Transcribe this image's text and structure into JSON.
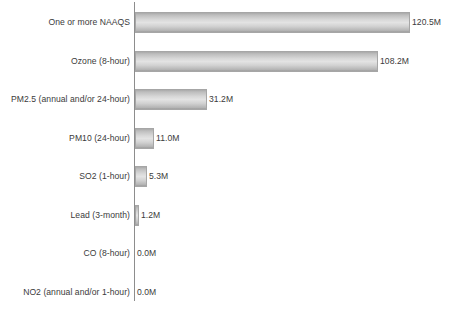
{
  "chart_data": {
    "type": "bar",
    "orientation": "horizontal",
    "title": "",
    "subtitle": "",
    "xlabel": "",
    "ylabel": "",
    "grid": false,
    "legend": null,
    "axis_line": "vertical baseline at value 0",
    "units": "millions of people",
    "value_suffix": "M",
    "xlim": [
      0,
      138
    ],
    "categories": [
      "One or more NAAQS",
      "Ozone (8-hour)",
      "PM2.5 (annual and/or 24-hour)",
      "PM10 (24-hour)",
      "SO2 (1-hour)",
      "Lead (3-month)",
      "CO (8-hour)",
      "NO2 (annual and/or 1-hour)"
    ],
    "values": [
      120.5,
      108.2,
      31.2,
      11.0,
      5.3,
      1.2,
      0.0,
      0.0
    ],
    "data_labels": [
      "120.5M",
      "108.2M",
      "31.2M",
      "11.0M",
      "5.3M",
      "1.2M",
      "0.0M",
      "0.0M"
    ],
    "colors": {
      "bar_fill_light": "#e3e3e3",
      "bar_fill_dark": "#a9a9a9",
      "bar_border": "#a6a6a6",
      "axis_line": "#8d8d8d",
      "text": "#3b3b3b",
      "background": "#ffffff"
    }
  },
  "rows": [
    {
      "label": "One or more NAAQS",
      "value_label": "120.5M",
      "bar_px": 275,
      "top_px": 12
    },
    {
      "label": "Ozone (8-hour)",
      "value_label": "108.2M",
      "bar_px": 243,
      "top_px": 51
    },
    {
      "label": "PM2.5 (annual and/or 24-hour)",
      "value_label": "31.2M",
      "bar_px": 72,
      "top_px": 89
    },
    {
      "label": "PM10 (24-hour)",
      "value_label": "11.0M",
      "bar_px": 19,
      "top_px": 128
    },
    {
      "label": "SO2 (1-hour)",
      "value_label": "5.3M",
      "bar_px": 12,
      "top_px": 166
    },
    {
      "label": "Lead (3-month)",
      "value_label": "1.2M",
      "bar_px": 4,
      "top_px": 205
    },
    {
      "label": "CO (8-hour)",
      "value_label": "0.0M",
      "bar_px": 0,
      "top_px": 243
    },
    {
      "label": "NO2 (annual and/or 1-hour)",
      "value_label": "0.0M",
      "bar_px": 0,
      "top_px": 282
    }
  ]
}
